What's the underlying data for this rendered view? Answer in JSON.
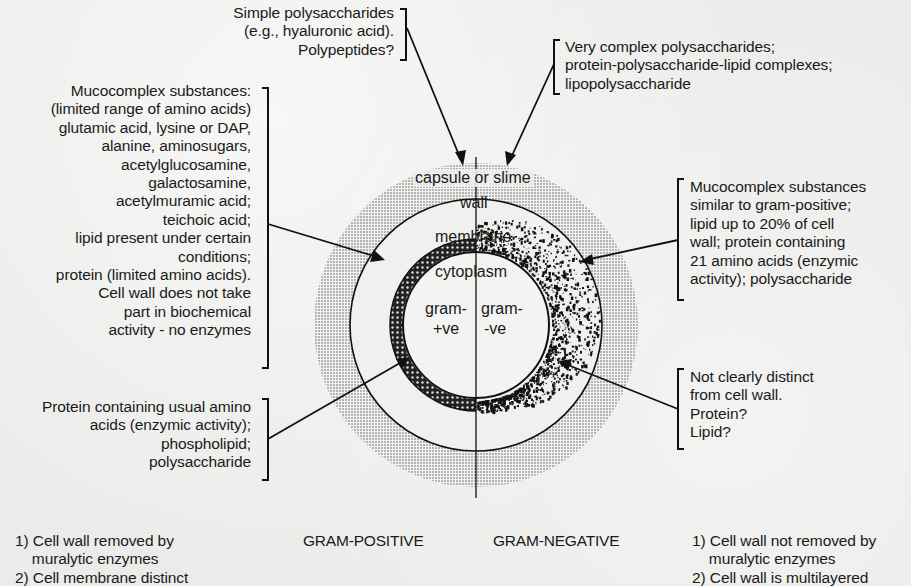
{
  "figure": {
    "callouts": {
      "capsule_gram_positive": {
        "lines": [
          "Simple polysaccharides",
          "(e.g., hyaluronic acid).",
          "Polypeptides?"
        ]
      },
      "capsule_gram_negative": {
        "lines": [
          "Very complex polysaccharides;",
          "protein-polysaccharide-lipid complexes;",
          "lipopolysaccharide"
        ]
      },
      "wall_gram_positive": {
        "lines": [
          "Mucocomplex substances:",
          "(limited range of amino acids)",
          "glutamic acid, lysine or DAP,",
          "alanine, aminosugars,",
          "acetylglucosamine,",
          "galactosamine,",
          "acetylmuramic acid;",
          "teichoic acid;",
          "lipid present under certain",
          "conditions;",
          "protein (limited amino acids).",
          "Cell wall does not take",
          "part in biochemical",
          "activity - no enzymes"
        ]
      },
      "wall_gram_negative": {
        "lines": [
          "Mucocomplex substances",
          "similar to gram-positive;",
          "lipid up to 20% of cell",
          "wall; protein containing",
          "21 amino acids (enzymic",
          "activity); polysaccharide"
        ]
      },
      "membrane_gram_positive": {
        "lines": [
          "Protein containing usual amino",
          "acids (enzymic activity);",
          "phospholipid;",
          "polysaccharide"
        ]
      },
      "membrane_gram_negative": {
        "lines": [
          "Not clearly distinct",
          "from cell wall.",
          "Protein?",
          "Lipid?"
        ]
      }
    },
    "layers": {
      "capsule": "capsule or slime",
      "wall": "wall",
      "membrane": "membrane",
      "cytoplasm": "cytoplasm",
      "left_half_top": "gram-",
      "left_half_bottom": "+ve",
      "right_half_top": "gram-",
      "right_half_bottom": "-ve"
    },
    "titles": {
      "gram_positive": "GRAM-POSITIVE",
      "gram_negative": "GRAM-NEGATIVE"
    },
    "footnotes": {
      "gram_positive": [
        "1) Cell wall removed by",
        "    muralytic enzymes",
        "2) Cell membrane distinct"
      ],
      "gram_negative": [
        "1) Cell wall not removed by",
        "    muralytic enzymes",
        "2) Cell wall is multilayered"
      ]
    }
  }
}
